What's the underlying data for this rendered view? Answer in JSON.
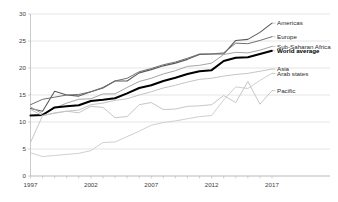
{
  "chart_data": {
    "type": "line",
    "title": "",
    "subtitle": "",
    "xlabel": "",
    "ylabel": "",
    "xlim": [
      1997,
      2017
    ],
    "ylim": [
      0,
      30
    ],
    "grid": true,
    "legend_position": "right-inline-labels",
    "x": [
      1997,
      1998,
      1999,
      2000,
      2001,
      2002,
      2003,
      2004,
      2005,
      2006,
      2007,
      2008,
      2009,
      2010,
      2011,
      2012,
      2013,
      2014,
      2015,
      2016,
      2017
    ],
    "x_ticks": [
      "1997",
      "2002",
      "2007",
      "2012",
      "2017"
    ],
    "x_tick_values": [
      1997,
      2002,
      2007,
      2012,
      2017
    ],
    "y_ticks": [
      "0",
      "5",
      "10",
      "15",
      "20",
      "25",
      "30"
    ],
    "y_tick_values": [
      0,
      5,
      10,
      15,
      20,
      25,
      30
    ],
    "series": [
      {
        "name": "Americas",
        "label": "Americas",
        "color": "#5a5a5a",
        "width": 1.1,
        "bold": false,
        "label_y": 28.3,
        "values": [
          12.5,
          12.0,
          15.7,
          15.0,
          14.8,
          15.6,
          16.3,
          17.6,
          17.6,
          19.1,
          19.7,
          20.4,
          20.9,
          21.6,
          22.5,
          22.6,
          22.6,
          25.1,
          25.3,
          26.6,
          28.3
        ]
      },
      {
        "name": "Europe",
        "label": "Europe",
        "color": "#6f6f6f",
        "width": 1.0,
        "bold": false,
        "label_y": 25.8,
        "values": [
          13.2,
          14.2,
          14.6,
          15.0,
          15.1,
          15.6,
          16.4,
          17.6,
          18.1,
          19.3,
          19.9,
          20.6,
          21.1,
          21.8,
          22.6,
          22.6,
          22.8,
          24.6,
          24.5,
          25.1,
          25.8
        ]
      },
      {
        "name": "Sub-Saharan Africa",
        "label": "Sub-Saharan Africa",
        "color": "#a6a6a6",
        "width": 1.0,
        "bold": false,
        "label_y": 24.0,
        "values": [
          12.8,
          11.5,
          12.6,
          13.5,
          14.2,
          14.3,
          15.2,
          15.2,
          16.4,
          17.5,
          18.1,
          18.9,
          19.5,
          20.3,
          20.5,
          20.9,
          22.5,
          22.9,
          22.8,
          23.3,
          24.0
        ]
      },
      {
        "name": "World average",
        "label": "World average",
        "color": "#000000",
        "width": 2.0,
        "bold": true,
        "label_y": 23.2,
        "values": [
          11.2,
          11.3,
          12.7,
          12.9,
          13.1,
          13.9,
          14.1,
          14.4,
          15.3,
          16.3,
          16.8,
          17.6,
          18.2,
          18.9,
          19.4,
          19.6,
          21.3,
          21.9,
          22.0,
          22.6,
          23.2
        ]
      },
      {
        "name": "Asia",
        "label": "Asia",
        "color": "#bdbdbd",
        "width": 0.9,
        "bold": false,
        "label_y": 19.8,
        "values": [
          12.3,
          11.2,
          11.6,
          12.0,
          12.2,
          13.2,
          13.5,
          14.0,
          14.3,
          15.0,
          15.6,
          16.3,
          16.8,
          17.4,
          17.9,
          18.1,
          18.5,
          18.8,
          19.0,
          19.4,
          19.8
        ]
      },
      {
        "name": "Arab states",
        "label": "Arab states",
        "color": "#c9c9c9",
        "width": 0.9,
        "bold": false,
        "label_y": 19.0,
        "values": [
          4.3,
          3.6,
          3.8,
          4.0,
          4.2,
          4.7,
          6.2,
          6.3,
          7.3,
          8.3,
          9.4,
          9.9,
          10.2,
          10.6,
          11.0,
          11.2,
          14.1,
          16.5,
          16.2,
          17.7,
          19.0
        ]
      },
      {
        "name": "Pacific",
        "label": "Pacific",
        "color": "#c0c0c0",
        "width": 0.9,
        "bold": false,
        "label_y": 15.8,
        "values": [
          6.2,
          11.2,
          11.7,
          12.0,
          11.7,
          12.9,
          12.7,
          10.8,
          11.0,
          13.2,
          13.6,
          12.3,
          12.4,
          12.9,
          13.0,
          13.2,
          14.9,
          13.6,
          17.5,
          13.3,
          15.8
        ]
      }
    ]
  },
  "axes": {
    "y_axis_name": "value-axis",
    "x_axis_name": "year-axis"
  }
}
